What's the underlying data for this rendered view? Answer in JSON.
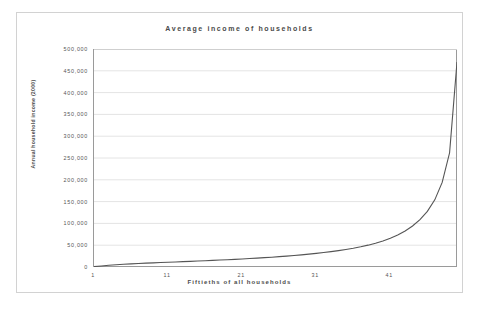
{
  "chart_data": {
    "type": "line",
    "title": "Average income of households",
    "xlabel": "Fiftieths of all households",
    "ylabel": "Annual household income (2000)",
    "grid": true,
    "legend": "none",
    "xlim": [
      1,
      50
    ],
    "ylim": [
      0,
      500000
    ],
    "ytick_labels": [
      "500,000",
      "450,000",
      "400,000",
      "350,000",
      "300,000",
      "250,000",
      "200,000",
      "150,000",
      "100,000",
      "50,000",
      "0"
    ],
    "ytick_values": [
      500000,
      450000,
      400000,
      350000,
      300000,
      250000,
      200000,
      150000,
      100000,
      50000,
      0
    ],
    "xtick_labels": [
      "1",
      "11",
      "21",
      "31",
      "41"
    ],
    "xtick_values": [
      1,
      11,
      21,
      31,
      41
    ],
    "series": [
      {
        "name": "Average household income",
        "color": "#555555",
        "x": [
          1,
          2,
          3,
          4,
          5,
          6,
          7,
          8,
          9,
          10,
          11,
          12,
          13,
          14,
          15,
          16,
          17,
          18,
          19,
          20,
          21,
          22,
          23,
          24,
          25,
          26,
          27,
          28,
          29,
          30,
          31,
          32,
          33,
          34,
          35,
          36,
          37,
          38,
          39,
          40,
          41,
          42,
          43,
          44,
          45,
          46,
          47,
          48,
          49,
          50
        ],
        "values": [
          900,
          2400,
          3900,
          5200,
          6300,
          7200,
          8000,
          8800,
          9500,
          10200,
          10900,
          11600,
          12300,
          13000,
          13700,
          14400,
          15200,
          16000,
          16800,
          17600,
          18500,
          19400,
          20400,
          21400,
          22500,
          23700,
          25000,
          26400,
          27900,
          29500,
          31200,
          33100,
          35200,
          37500,
          40100,
          43000,
          46300,
          50100,
          54500,
          59700,
          65900,
          73400,
          82600,
          94000,
          108500,
          127500,
          154000,
          194000,
          262000,
          470000
        ]
      }
    ]
  }
}
